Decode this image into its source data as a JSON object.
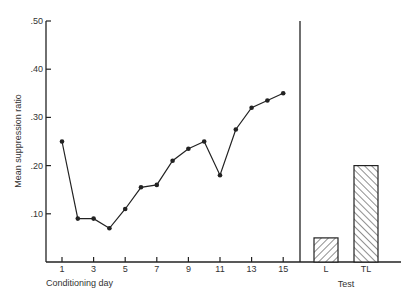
{
  "chart_data": {
    "type": "line+bar",
    "title": "",
    "ylabel": "Mean suppression ratio",
    "ylim": [
      0,
      0.5
    ],
    "yticks": [
      0.1,
      0.2,
      0.3,
      0.4,
      0.5
    ],
    "ytick_labels": [
      ".10",
      ".20",
      ".30",
      ".40",
      ".50"
    ],
    "grid": false,
    "legend": null,
    "panels": [
      {
        "name": "conditioning",
        "type": "line",
        "xlabel": "Conditioning day",
        "x": [
          1,
          2,
          3,
          4,
          5,
          6,
          7,
          8,
          9,
          10,
          11,
          12,
          13,
          14,
          15
        ],
        "xtick_labels": [
          "1",
          "3",
          "5",
          "7",
          "9",
          "11",
          "13",
          "15"
        ],
        "xticks": [
          1,
          3,
          5,
          7,
          9,
          11,
          13,
          15
        ],
        "values": [
          0.25,
          0.09,
          0.09,
          0.07,
          0.11,
          0.155,
          0.16,
          0.21,
          0.235,
          0.25,
          0.18,
          0.275,
          0.32,
          0.335,
          0.35
        ]
      },
      {
        "name": "test",
        "type": "bar",
        "xlabel": "Test",
        "categories": [
          "L",
          "TL"
        ],
        "values": [
          0.05,
          0.2
        ],
        "hatch": [
          "\\\\",
          "//"
        ]
      }
    ]
  },
  "colors": {
    "ink": "#222222",
    "background": "#ffffff"
  }
}
